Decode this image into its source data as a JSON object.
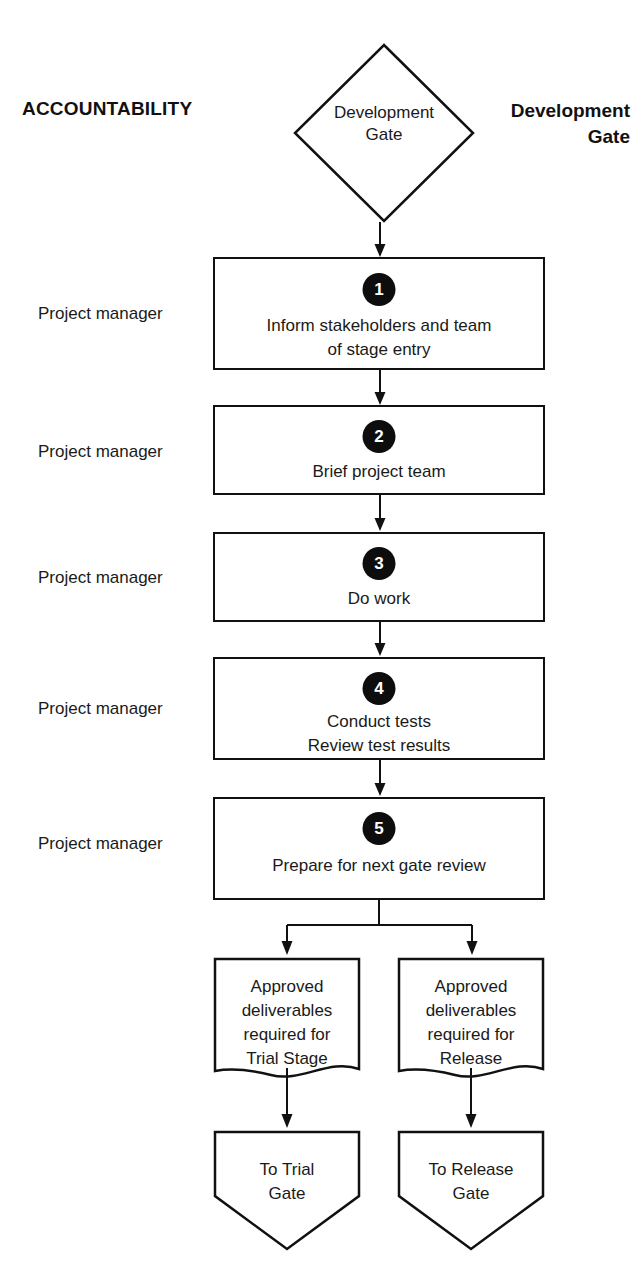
{
  "headings": {
    "accountability": "ACCOUNTABILITY",
    "gate_side_label_line1": "Development",
    "gate_side_label_line2": "Gate"
  },
  "gate": {
    "line1": "Development",
    "line2": "Gate"
  },
  "roles": [
    {
      "label": "Project manager"
    },
    {
      "label": "Project manager"
    },
    {
      "label": "Project manager"
    },
    {
      "label": "Project manager"
    },
    {
      "label": "Project manager"
    }
  ],
  "steps": [
    {
      "number": "1",
      "line1": "Inform stakeholders and team",
      "line2": "of stage entry"
    },
    {
      "number": "2",
      "line1": "Brief project team",
      "line2": ""
    },
    {
      "number": "3",
      "line1": "Do work",
      "line2": ""
    },
    {
      "number": "4",
      "line1": "Conduct tests",
      "line2": "Review test results"
    },
    {
      "number": "5",
      "line1": "Prepare for next gate review",
      "line2": ""
    }
  ],
  "deliverables": [
    {
      "line1": "Approved",
      "line2": "deliverables",
      "line3": "required for",
      "line4": "Trial Stage"
    },
    {
      "line1": "Approved",
      "line2": "deliverables",
      "line3": "required for",
      "line4": "Release"
    }
  ],
  "terminators": [
    {
      "line1": "To Trial",
      "line2": "Gate"
    },
    {
      "line1": "To Release",
      "line2": "Gate"
    }
  ],
  "colors": {
    "stroke": "#111111",
    "badge_fill": "#0d0d0d",
    "badge_text": "#ffffff",
    "background": "#ffffff",
    "text": "#1a1a1a"
  }
}
